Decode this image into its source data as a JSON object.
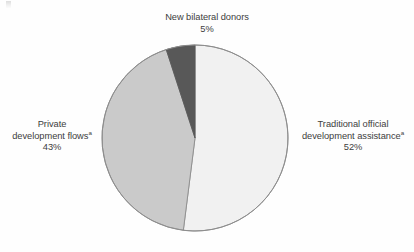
{
  "figure": {
    "background_color": "#fefefe",
    "outline_color": "#8d8d8d"
  },
  "labels": {
    "new_bilateral_donors": {
      "line1": "New bilateral donors",
      "value": "5%"
    },
    "traditional_oda": {
      "line1": "Traditional official",
      "line2": "development assistance",
      "footnote_marker": "a",
      "value": "52%"
    },
    "private_flows": {
      "line1": "Private",
      "line2": "development flows",
      "footnote_marker": "a",
      "value": "43%"
    }
  },
  "chart_data": {
    "type": "pie",
    "title": "",
    "subtitle": "",
    "xlabel": "",
    "ylabel": "",
    "legend_position": "none",
    "grid": false,
    "start_angle_deg": 0,
    "direction": "clockwise",
    "center": {
      "x": 195,
      "y": 138
    },
    "radius": 93,
    "categories": [
      "Traditional official development assistance",
      "Private development flows",
      "New bilateral donors"
    ],
    "values": [
      52,
      43,
      5
    ],
    "value_labels": [
      "52%",
      "43%",
      "5%"
    ],
    "colors": [
      "#f1f1f1",
      "#cacaca",
      "#585858"
    ],
    "slices": [
      {
        "name": "Traditional official development assistance",
        "value": 52,
        "value_label": "52%",
        "color": "#f1f1f1",
        "start_angle_deg": 0,
        "end_angle_deg": 187.2,
        "footnote_marker": "a"
      },
      {
        "name": "Private development flows",
        "value": 43,
        "value_label": "43%",
        "color": "#cacaca",
        "start_angle_deg": 187.2,
        "end_angle_deg": 342.0,
        "footnote_marker": "a"
      },
      {
        "name": "New bilateral donors",
        "value": 5,
        "value_label": "5%",
        "color": "#585858",
        "start_angle_deg": 342.0,
        "end_angle_deg": 360.0,
        "footnote_marker": ""
      }
    ]
  }
}
